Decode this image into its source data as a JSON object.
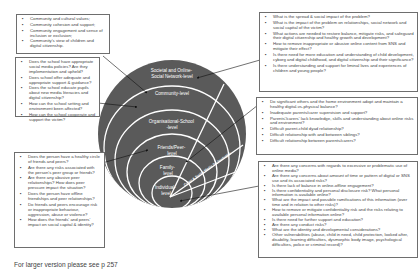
{
  "levels": [
    {
      "id": "societal",
      "label_lines": [
        "Societal and Online-",
        "Social Network-level"
      ]
    },
    {
      "id": "community",
      "label_lines": [
        "Community-level"
      ]
    },
    {
      "id": "school",
      "label_lines": [
        "Organisational-School",
        "-level"
      ]
    },
    {
      "id": "peer",
      "label_lines": [
        "Friends/Peer-",
        "level"
      ]
    },
    {
      "id": "family",
      "label_lines": [
        "Family-",
        "level"
      ]
    },
    {
      "id": "individual",
      "label_lines": [
        "Individual-",
        "level"
      ]
    }
  ],
  "wedge_label": "Cyber & Social Media Technologies",
  "boxes": {
    "community": {
      "items": [
        "Community and cultural values;",
        "Community cohesion and support;",
        "Community engagement and sense of inclusion or exclusion;",
        "Community's view of children and digital citizenship."
      ]
    },
    "school": {
      "items": [
        "Does the school have appropriate social media policies? Are they implementation and upheld?",
        "Does school offer adequate and appropriate support & guidance?",
        "Does the school educate pupils about new media literacies and digital citizenship?",
        "How can the school setting and environment been affected?",
        "How can the school cooperate and support the victim?"
      ]
    },
    "peer": {
      "items": [
        "Does the person have a healthy circle of friends and peers?",
        "Are there any risks associated with the person's peer group or friends?",
        "Are there any abusive peer relationships? How does peer pressure impact the situation?",
        "Does the person have offline friendships and peer relationships?",
        "Do friends and peers encourage risk or inappropriate behaviour, aggression, abuse or violence?",
        "How does the friends' and peers' impact on social capital & identity?"
      ]
    },
    "societal": {
      "items": [
        "What is the spread & social impact of the problem?",
        "What is the impact of the problem on relationships, social network and social capital of the victim?",
        "What actions are needed to restore balance, mitigate risks, and safeguard their digital citizenship and healthy growth and development?",
        "How to remove inappropriate or abusive online content from SNS and mitigate their effect?",
        "Is there need for more education and understanding of child development, cyborg and digital childhood, and digital citizenship and their significance?",
        "Is there understanding and support for liminal lives and experiences of children and young people?"
      ]
    },
    "family": {
      "items": [
        "Do significant others and the home environment adopt and maintain a healthy digital-vs-physical balance?",
        "Inadequate parents/carer supervision and support?",
        "Parents'/carers' lack knowledge, skills and understanding about online risks and environment?",
        "Difficult parent-child dyad relationship?",
        "Difficult relationship with and between siblings?",
        "Difficult relationship between parents/carers?"
      ]
    },
    "individual": {
      "items": [
        "Are there any concerns with regards to excessive or problematic use of online media?",
        "Are there any concerns about amount of time or pattern of digital or SNS use and its associated risks?",
        "Is there lack of balance in online-offline engagement?",
        "Is there confidentiality and personal disclosure risk? What personal information is available online?",
        "What are the impact and possible ramifications of this information (over time and in relation to other risks)?",
        "How to remove or mitigate confidentiality risk and the risks relating to available personal information online?",
        "Is there need for further support and education?",
        "Are there any conduct risks?",
        "What are the identity and developmental considerations?",
        "Other vulnerabilities (abuse, child in need, child protection, looked after, disability, learning difficulties, dysmorphic body image, psychological difficulties, police or criminal record)?"
      ]
    }
  },
  "caption": "For larger version please see p 257",
  "colors": {
    "circle_fill": "#5a5a5a",
    "ring_stroke": "#ffffff",
    "box_border": "#6e6e6e",
    "arrow": "#111111"
  }
}
